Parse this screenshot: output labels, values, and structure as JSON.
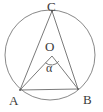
{
  "figure": {
    "type": "geometry-diagram",
    "background_color": "#ffffff",
    "stroke_color": "#6b6b6b",
    "label_color": "#3a3a3a",
    "canvas": {
      "width": 103,
      "height": 112
    }
  },
  "circle": {
    "name": "circumscribed-circle",
    "center_x": 50,
    "center_y": 55,
    "radius": 45
  },
  "points": [
    {
      "id": "C",
      "label": "C",
      "x": 52,
      "y": 11,
      "label_position": "above"
    },
    {
      "id": "A",
      "label": "A",
      "x": 20,
      "y": 90,
      "label_position": "below-left"
    },
    {
      "id": "B",
      "label": "B",
      "x": 78,
      "y": 89,
      "label_position": "below-right"
    },
    {
      "id": "O",
      "label": "O",
      "x": 52,
      "y": 56,
      "label_position": "above"
    }
  ],
  "segments": [
    {
      "id": "CA",
      "from": "C",
      "to": "A"
    },
    {
      "id": "CB",
      "from": "C",
      "to": "B"
    },
    {
      "id": "OA",
      "from": "O",
      "to": "A"
    },
    {
      "id": "OB",
      "from": "O",
      "to": "B"
    },
    {
      "id": "AB",
      "from": "A",
      "to": "B"
    }
  ],
  "angle": {
    "id": "alpha",
    "label": "α",
    "vertex": "O",
    "between": [
      "OA",
      "OB"
    ],
    "arc_radius": 9
  },
  "labels": {
    "C": "C",
    "A": "A",
    "B": "B",
    "O": "O",
    "alpha": "α"
  }
}
